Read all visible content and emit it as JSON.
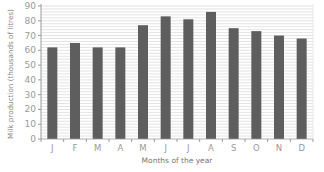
{
  "chart_data": {
    "type": "bar",
    "title": "",
    "xlabel": "Months of the year",
    "ylabel": "Milk production (thousands of litres)",
    "categories": [
      "J",
      "F",
      "M",
      "A",
      "M",
      "J",
      "J",
      "A",
      "S",
      "O",
      "N",
      "D"
    ],
    "values": [
      62,
      65,
      62,
      62,
      77,
      83,
      81,
      86,
      75,
      73,
      70,
      68
    ],
    "ylim": [
      0,
      90
    ],
    "yticks": [
      0,
      10,
      20,
      30,
      40,
      50,
      60,
      70,
      80,
      90
    ],
    "grid": true,
    "legend": null
  },
  "colors": {
    "bar": "#5e5e5e",
    "grid": "#dcdcdc",
    "axis": "#9a9a9a"
  }
}
